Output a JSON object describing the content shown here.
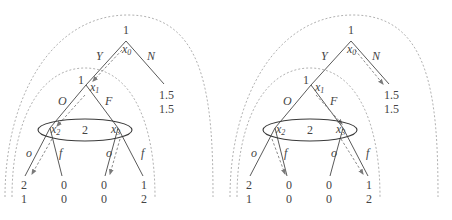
{
  "trees": [
    {
      "id": "left",
      "root_player": "1",
      "root_node": "x0",
      "x1_player": "1",
      "x1_node": "x1",
      "x2_node": "x2",
      "x3_node": "x3",
      "info_set_player": "2",
      "actions": {
        "Y": "Y",
        "N": "N",
        "O": "O",
        "F": "F",
        "o_left": "o",
        "f_left": "f",
        "o_right": "o",
        "f_right": "f"
      },
      "payoff_N": [
        "1.5",
        "1.5"
      ],
      "payoffs": [
        [
          "2",
          "1"
        ],
        [
          "0",
          "0"
        ],
        [
          "0",
          "0"
        ],
        [
          "1",
          "2"
        ]
      ],
      "equilibrium_path": [
        "x0-Y",
        "x1-O",
        "x2-o",
        "x3-o"
      ]
    },
    {
      "id": "right",
      "root_player": "1",
      "root_node": "x0",
      "x1_player": "1",
      "x1_node": "x1",
      "x2_node": "x2",
      "x3_node": "x3",
      "info_set_player": "2",
      "actions": {
        "Y": "Y",
        "N": "N",
        "O": "O",
        "F": "F",
        "o_left": "o",
        "f_left": "f",
        "o_right": "o",
        "f_right": "f"
      },
      "payoff_N": [
        "1.5",
        "1.5"
      ],
      "payoffs": [
        [
          "2",
          "1"
        ],
        [
          "0",
          "0"
        ],
        [
          "0",
          "0"
        ],
        [
          "1",
          "2"
        ]
      ],
      "equilibrium_path": [
        "x0-N",
        "x1-F",
        "x2-f",
        "x3-f"
      ]
    }
  ],
  "colors": {
    "edge": "#5a5a5a",
    "arrow": "#8a8a8a",
    "arc": "#a8a8a8",
    "info_set": "#3a3a3a",
    "text": "#444444"
  }
}
